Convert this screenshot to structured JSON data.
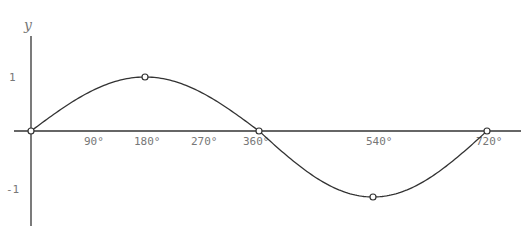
{
  "chart_data": {
    "type": "line",
    "title": "",
    "xlabel": "",
    "ylabel": "y",
    "x_tick_labels": [
      "90°",
      "180°",
      "270°",
      "360°",
      "540°",
      "720°"
    ],
    "x_tick_values": [
      90,
      180,
      270,
      360,
      540,
      720
    ],
    "y_tick_labels": [
      "1",
      "-1"
    ],
    "y_tick_values": [
      1,
      -1
    ],
    "xlim": [
      0,
      720
    ],
    "ylim": [
      -1,
      1
    ],
    "grid": false,
    "series": [
      {
        "name": "y = sin(x/2)",
        "x": [
          0,
          90,
          180,
          270,
          360,
          450,
          540,
          630,
          720
        ],
        "values": [
          0,
          0.71,
          1,
          0.71,
          0,
          -0.71,
          -1,
          -0.71,
          0
        ]
      }
    ],
    "marked_points": [
      {
        "x": 0,
        "y": 0
      },
      {
        "x": 180,
        "y": 1
      },
      {
        "x": 360,
        "y": 0
      },
      {
        "x": 540,
        "y": -1
      },
      {
        "x": 720,
        "y": 0
      }
    ]
  },
  "labels": {
    "y_axis": "y",
    "y1": "1",
    "yneg1": "-1",
    "x90": "90°",
    "x180": "180°",
    "x270": "270°",
    "x360": "360°",
    "x540": "540°",
    "x720": "720°"
  }
}
